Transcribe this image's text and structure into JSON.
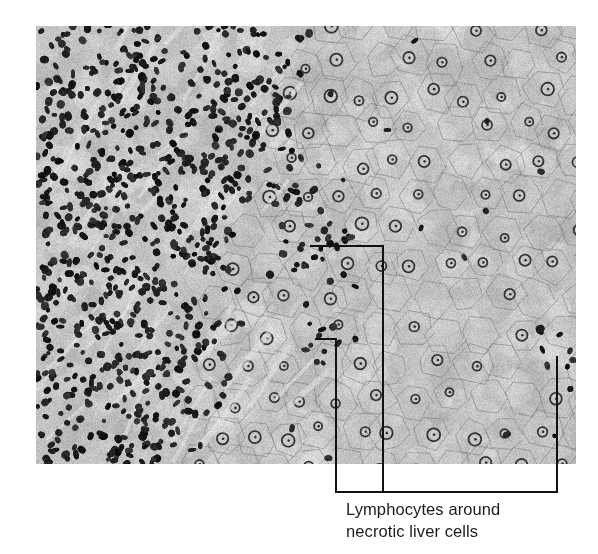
{
  "figure": {
    "type": "histology-micrograph",
    "stain": "grayscale",
    "regions": [
      {
        "name": "lymphocytic-infiltrate",
        "description": "dense dark lymphocyte nuclei",
        "side": "left"
      },
      {
        "name": "hepatocytes",
        "description": "pale polygonal liver cells with round nuclei",
        "side": "right"
      }
    ],
    "colors": {
      "background": "#ffffff",
      "tissue_base": "#bdbdbd",
      "nucleus_dark": "#1a1a1a",
      "leader_line": "#111111",
      "label_text": "#1c1c1c"
    }
  },
  "annotation": {
    "label_lines": [
      "Lymphocytes around",
      "necrotic liver cells"
    ],
    "pointer_count": 3
  }
}
